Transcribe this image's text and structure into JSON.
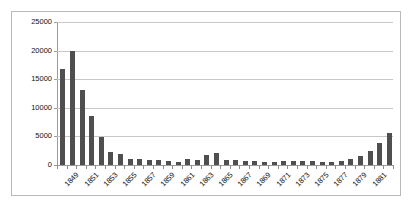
{
  "chart_data": {
    "type": "bar",
    "title": "",
    "subtitle": "",
    "xlabel": "",
    "ylabel": "",
    "ylim": [
      0,
      25000
    ],
    "ytick_values": [
      0,
      5000,
      10000,
      15000,
      20000,
      25000
    ],
    "ytick_labels": [
      "0",
      "5000",
      "10000",
      "15000",
      "20000",
      "25000"
    ],
    "grid": true,
    "legend": false,
    "legend_position": "none",
    "bar_color": "#4f4f4f",
    "categories": [
      1848,
      1849,
      1850,
      1851,
      1852,
      1853,
      1854,
      1855,
      1856,
      1857,
      1858,
      1859,
      1860,
      1861,
      1862,
      1863,
      1864,
      1865,
      1866,
      1867,
      1868,
      1869,
      1870,
      1871,
      1872,
      1873,
      1874,
      1875,
      1876,
      1877,
      1878,
      1879,
      1880,
      1881,
      1882
    ],
    "xtick_labels": [
      "1849",
      "1851",
      "1853",
      "1855",
      "1857",
      "1859",
      "1861",
      "1863",
      "1865",
      "1867",
      "1869",
      "1871",
      "1873",
      "1875",
      "1877",
      "1879",
      "1881"
    ],
    "values": [
      16700,
      20000,
      13200,
      8600,
      4900,
      2300,
      1950,
      1000,
      1000,
      850,
      800,
      700,
      500,
      1100,
      950,
      1800,
      2050,
      950,
      900,
      700,
      650,
      600,
      600,
      650,
      700,
      700,
      650,
      600,
      500,
      700,
      1100,
      1500,
      2400,
      3800,
      5550
    ]
  }
}
